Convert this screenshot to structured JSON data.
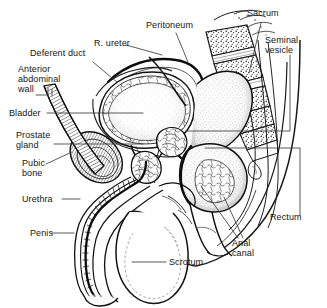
{
  "figure": {
    "type": "anatomical-line-diagram",
    "background_color": "#ffffff",
    "ink_color": "#141414",
    "leader_line_color": "#3c3c3c",
    "width": 327,
    "height": 308
  },
  "labels": {
    "deferent_duct": "Deferent duct",
    "anterior_abdominal_wall_l1": "Anterior",
    "anterior_abdominal_wall_l2": "abdominal",
    "anterior_abdominal_wall_l3": "wall",
    "bladder": "Bladder",
    "prostate_gland_l1": "Prostate",
    "prostate_gland_l2": "gland",
    "pubic_bone_l1": "Pubic",
    "pubic_bone_l2": "bone",
    "urethra": "Urethra",
    "penis": "Penis",
    "r_ureter": "R. ureter",
    "peritoneum": "Peritoneum",
    "sacrum": "Sacrum",
    "seminal_vesicle_l1": "Seminal",
    "seminal_vesicle_l2": "vesicle",
    "rectum": "Rectum",
    "anal_canal_l1": "Anal",
    "anal_canal_l2": "canal",
    "scrotum": "Scrotum"
  },
  "structures": [
    {
      "name": "deferent-duct",
      "label": "Deferent duct"
    },
    {
      "name": "anterior-abdominal-wall",
      "label": "Anterior abdominal wall"
    },
    {
      "name": "bladder",
      "label": "Bladder"
    },
    {
      "name": "prostate-gland",
      "label": "Prostate gland"
    },
    {
      "name": "pubic-bone",
      "label": "Pubic bone"
    },
    {
      "name": "urethra",
      "label": "Urethra"
    },
    {
      "name": "penis",
      "label": "Penis"
    },
    {
      "name": "right-ureter",
      "label": "R. ureter"
    },
    {
      "name": "peritoneum",
      "label": "Peritoneum"
    },
    {
      "name": "sacrum",
      "label": "Sacrum"
    },
    {
      "name": "seminal-vesicle",
      "label": "Seminal vesicle"
    },
    {
      "name": "rectum",
      "label": "Rectum"
    },
    {
      "name": "anal-canal",
      "label": "Anal canal"
    },
    {
      "name": "scrotum",
      "label": "Scrotum"
    }
  ]
}
